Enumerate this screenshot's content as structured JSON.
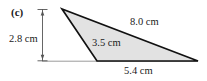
{
  "figure": {
    "part_label": "(c)",
    "shape": "triangle",
    "fill_color": "#e2e2e2",
    "stroke_color": "#111111",
    "guide_color": "#9a9a9a",
    "background_color": "#ffffff",
    "vertices": {
      "apex": [
        62,
        9
      ],
      "bottom_left": [
        97,
        61
      ],
      "bottom_right": [
        198,
        61
      ]
    },
    "height_dimension": {
      "label": "2.8 cm",
      "x": 42,
      "y_top": 9,
      "y_bottom": 61,
      "tick_half_width": 5
    },
    "baseline": {
      "x_start": 42,
      "x_end": 198,
      "y": 61
    },
    "measurements": [
      {
        "name": "height",
        "label": "2.8 cm"
      },
      {
        "name": "hypotenuse",
        "label": "8.0 cm"
      },
      {
        "name": "left-side",
        "label": "3.5 cm"
      },
      {
        "name": "base",
        "label": "5.4 cm"
      }
    ]
  }
}
